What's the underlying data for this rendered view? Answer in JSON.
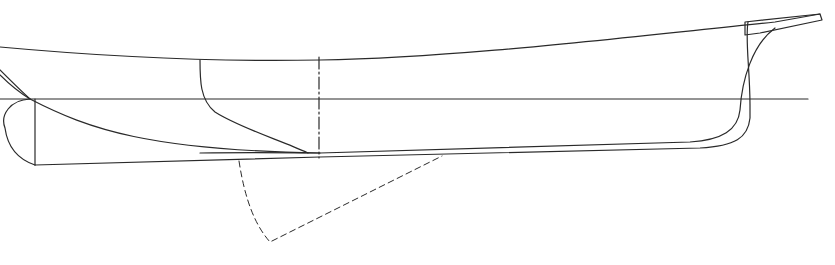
{
  "drawing": {
    "type": "hull-profile-line-drawing",
    "stroke_color": "#2a2a2a",
    "background": "#ffffff",
    "elements": [
      {
        "name": "sheer-line",
        "style": "solid"
      },
      {
        "name": "waterline",
        "style": "solid"
      },
      {
        "name": "keel-bottom-line",
        "style": "solid"
      },
      {
        "name": "midship-section-line",
        "style": "dash-dot"
      },
      {
        "name": "stem-profile",
        "style": "solid"
      },
      {
        "name": "stern-transom",
        "style": "solid"
      },
      {
        "name": "bilge-diagonal",
        "style": "solid"
      },
      {
        "name": "buttock-curve",
        "style": "solid"
      },
      {
        "name": "centerboard-outline",
        "style": "dashed"
      }
    ]
  }
}
